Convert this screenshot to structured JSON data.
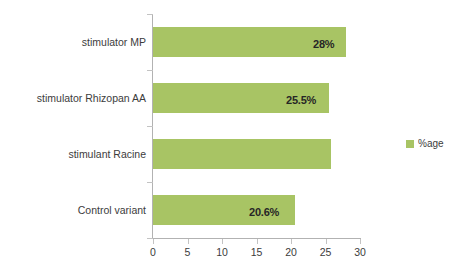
{
  "chart_data": {
    "type": "bar",
    "orientation": "horizontal",
    "title": "",
    "xlabel": "",
    "ylabel": "",
    "categories": [
      "Control variant",
      "stimulant Racine",
      "stimulator Rhizopan AA",
      "stimulator MP"
    ],
    "values": [
      20.6,
      25.8,
      25.5,
      28
    ],
    "data_labels": [
      "20.6%",
      "",
      "25.5%",
      "28%"
    ],
    "series": [
      {
        "name": "%age",
        "values": [
          20.6,
          25.8,
          25.5,
          28
        ],
        "color": "#a8c464"
      }
    ],
    "xlim": [
      0,
      30
    ],
    "xticks": [
      0,
      5,
      10,
      15,
      20,
      25,
      30
    ],
    "xtick_labels": [
      "0",
      "5",
      "10",
      "15",
      "20",
      "25",
      "30"
    ],
    "grid": false,
    "legend": {
      "position": "right",
      "entries": [
        {
          "label": "%age",
          "color": "#a8c464"
        }
      ]
    },
    "background_color": "#ffffff",
    "axis_color": "#b2b2b2",
    "text_color": "#3c3c3c"
  },
  "axis": {
    "tick_0": "0",
    "tick_1": "5",
    "tick_2": "10",
    "tick_3": "15",
    "tick_4": "20",
    "tick_5": "25",
    "tick_6": "30"
  },
  "categories": {
    "cat_0": "Control variant",
    "cat_1": "stimulant Racine",
    "cat_2": "stimulator Rhizopan AA",
    "cat_3": "stimulator MP"
  },
  "bar_labels": {
    "bar_0": "20.6%",
    "bar_1": "",
    "bar_2": "25.5%",
    "bar_3": "28%"
  },
  "legend": {
    "series_name": "%age"
  }
}
